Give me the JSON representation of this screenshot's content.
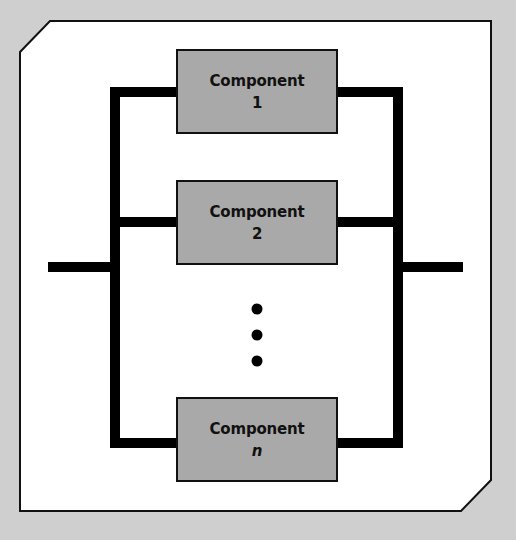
{
  "diagram": {
    "type": "parallel-system-block-diagram",
    "colors": {
      "page_background": "#cfcfcf",
      "frame_fill": "#ffffff",
      "frame_stroke": "#111111",
      "line": "#000000",
      "component_fill": "#a9a9a9",
      "component_stroke": "#111111",
      "text": "#111111"
    },
    "components": [
      {
        "name": "Component",
        "index": "1",
        "italic": false
      },
      {
        "name": "Component",
        "index": "2",
        "italic": false
      },
      {
        "name": "Component",
        "index": "n",
        "italic": true
      }
    ],
    "ellipsis": "vertical-dots",
    "ellipsis_count": 3
  }
}
